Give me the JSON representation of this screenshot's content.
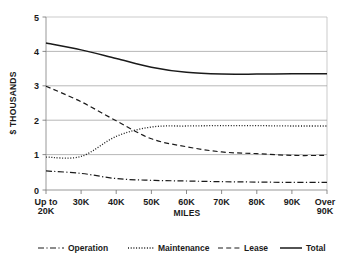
{
  "chart_data": {
    "type": "line",
    "title": "",
    "xlabel": "MILES",
    "ylabel": "$ THOUSANDS",
    "x": [
      "Up to 20K",
      "30K",
      "40K",
      "50K",
      "60K",
      "70K",
      "80K",
      "90K",
      "Over 90K"
    ],
    "categories": [
      "Up to 20K",
      "30K",
      "40K",
      "50K",
      "60K",
      "70K",
      "80K",
      "90K",
      "Over 90K"
    ],
    "ylim": [
      0,
      5
    ],
    "yticks": [
      0,
      1,
      2,
      3,
      4,
      5
    ],
    "ytick_labels": [
      "0",
      "1",
      "2",
      "3",
      "4",
      "5"
    ],
    "grid": true,
    "legend_position": "bottom",
    "series": [
      {
        "name": "Operation",
        "line_style": "dash-dot",
        "color": "#1a1a1a",
        "values": [
          0.55,
          0.48,
          0.33,
          0.28,
          0.26,
          0.24,
          0.23,
          0.22,
          0.22
        ]
      },
      {
        "name": "Maintenance",
        "line_style": "dotted",
        "color": "#1a1a1a",
        "values": [
          0.95,
          0.97,
          1.55,
          1.82,
          1.85,
          1.86,
          1.86,
          1.85,
          1.85
        ]
      },
      {
        "name": "Lease",
        "line_style": "dashed",
        "color": "#1a1a1a",
        "values": [
          3.0,
          2.55,
          2.0,
          1.48,
          1.25,
          1.1,
          1.05,
          1.0,
          1.0
        ]
      },
      {
        "name": "Total",
        "line_style": "solid",
        "color": "#1a1a1a",
        "values": [
          4.25,
          4.05,
          3.8,
          3.55,
          3.4,
          3.35,
          3.35,
          3.36,
          3.36
        ]
      }
    ]
  },
  "axes": {
    "y_title": "$ THOUSANDS",
    "x_title": "MILES",
    "y_tick_labels": [
      "5",
      "4",
      "3",
      "2",
      "1",
      "0"
    ],
    "x_tick_labels": [
      {
        "line1": "Up to",
        "line2": "20K"
      },
      {
        "line1": "30K",
        "line2": ""
      },
      {
        "line1": "40K",
        "line2": ""
      },
      {
        "line1": "50K",
        "line2": ""
      },
      {
        "line1": "60K",
        "line2": ""
      },
      {
        "line1": "70K",
        "line2": ""
      },
      {
        "line1": "80K",
        "line2": ""
      },
      {
        "line1": "90K",
        "line2": ""
      },
      {
        "line1": "Over",
        "line2": "90K"
      }
    ]
  },
  "legend": {
    "items": [
      {
        "label": "Operation",
        "style": "dash-dot"
      },
      {
        "label": "Maintenance",
        "style": "dotted"
      },
      {
        "label": "Lease",
        "style": "dashed"
      },
      {
        "label": "Total",
        "style": "solid"
      }
    ]
  },
  "colors": {
    "ink": "#1a1a1a",
    "grid": "#9a9a9a",
    "frame": "#b5b5b5",
    "background": "#ffffff"
  }
}
